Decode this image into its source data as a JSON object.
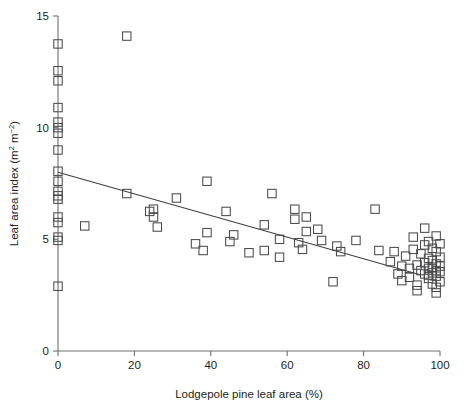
{
  "chart_data": {
    "type": "scatter",
    "title": "",
    "xlabel": "Lodgepole pine leaf area (%)",
    "ylabel": "Leaf area index (m² m⁻²)",
    "ylabel_parts": {
      "main": "Leaf area index (m",
      "sup1": "2",
      "mid": " m",
      "sup2": "−2",
      "tail": ")"
    },
    "xlim": [
      0,
      100
    ],
    "ylim": [
      0,
      15
    ],
    "xticks": [
      0,
      20,
      40,
      60,
      80,
      100
    ],
    "xtick_labels": [
      "0",
      "20",
      "40",
      "60",
      "80",
      "100"
    ],
    "yticks": [
      0,
      5,
      10,
      15
    ],
    "ytick_labels": [
      "0",
      "5",
      "10",
      "15"
    ],
    "grid": false,
    "legend": false,
    "marker": "open-square",
    "marker_color": "#4a4a4c",
    "axis_color": "#6d6e70",
    "line_color": "#3f3f41",
    "trendline": {
      "type": "linear-fit",
      "x": [
        0,
        95
      ],
      "y": [
        8.0,
        3.4
      ]
    },
    "points": [
      [
        0,
        13.75
      ],
      [
        0,
        12.55
      ],
      [
        0,
        12.1
      ],
      [
        0,
        10.9
      ],
      [
        0,
        10.25
      ],
      [
        0,
        10.0
      ],
      [
        0,
        9.75
      ],
      [
        0,
        9.0
      ],
      [
        0,
        8.05
      ],
      [
        0,
        7.6
      ],
      [
        0,
        7.15
      ],
      [
        0,
        6.95
      ],
      [
        0,
        6.8
      ],
      [
        0,
        6.0
      ],
      [
        0,
        5.75
      ],
      [
        0,
        5.1
      ],
      [
        0,
        4.95
      ],
      [
        0,
        2.9
      ],
      [
        7,
        5.6
      ],
      [
        18,
        14.1
      ],
      [
        18,
        7.05
      ],
      [
        24,
        6.25
      ],
      [
        25,
        6.0
      ],
      [
        26,
        5.55
      ],
      [
        25,
        6.35
      ],
      [
        31,
        6.85
      ],
      [
        36,
        4.8
      ],
      [
        39,
        7.6
      ],
      [
        39,
        5.3
      ],
      [
        38,
        4.5
      ],
      [
        44,
        6.25
      ],
      [
        45,
        4.9
      ],
      [
        46,
        5.2
      ],
      [
        50,
        4.4
      ],
      [
        54,
        5.65
      ],
      [
        54,
        4.5
      ],
      [
        56,
        7.05
      ],
      [
        58,
        5.0
      ],
      [
        58,
        4.2
      ],
      [
        62,
        6.35
      ],
      [
        62,
        5.9
      ],
      [
        63,
        4.85
      ],
      [
        65,
        6.0
      ],
      [
        65,
        5.35
      ],
      [
        64,
        4.55
      ],
      [
        68,
        5.45
      ],
      [
        69,
        4.95
      ],
      [
        72,
        3.1
      ],
      [
        73,
        4.7
      ],
      [
        74,
        4.45
      ],
      [
        78,
        4.95
      ],
      [
        83,
        6.35
      ],
      [
        84,
        4.5
      ],
      [
        87,
        4.0
      ],
      [
        88,
        4.45
      ],
      [
        89,
        3.45
      ],
      [
        90,
        3.8
      ],
      [
        90,
        3.15
      ],
      [
        91,
        4.25
      ],
      [
        92,
        3.7
      ],
      [
        92,
        3.3
      ],
      [
        93,
        5.1
      ],
      [
        93,
        4.55
      ],
      [
        94,
        3.85
      ],
      [
        94,
        2.95
      ],
      [
        95,
        4.35
      ],
      [
        95,
        3.6
      ],
      [
        96,
        5.5
      ],
      [
        96,
        4.75
      ],
      [
        96,
        3.95
      ],
      [
        96,
        3.45
      ],
      [
        97,
        4.9
      ],
      [
        97,
        4.15
      ],
      [
        97,
        3.7
      ],
      [
        97,
        3.4
      ],
      [
        97,
        3.25
      ],
      [
        98,
        4.6
      ],
      [
        98,
        4.05
      ],
      [
        98,
        3.75
      ],
      [
        98,
        3.5
      ],
      [
        98,
        3.0
      ],
      [
        99,
        5.15
      ],
      [
        99,
        4.45
      ],
      [
        99,
        3.9
      ],
      [
        99,
        3.6
      ],
      [
        99,
        3.35
      ],
      [
        99,
        2.85
      ],
      [
        100,
        4.8
      ],
      [
        100,
        4.2
      ],
      [
        100,
        3.8
      ],
      [
        100,
        3.55
      ],
      [
        100,
        3.1
      ],
      [
        94,
        2.7
      ],
      [
        99,
        2.6
      ]
    ]
  }
}
